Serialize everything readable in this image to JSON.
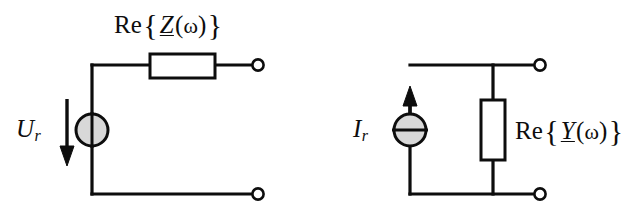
{
  "figure": {
    "width": 635,
    "height": 218,
    "background_color": "#ffffff",
    "line_color": "#0d0d0d",
    "source_fill_color": "#d8d8d8",
    "resistor_fill_color": "#ffffff"
  },
  "left_circuit": {
    "name": "series-equivalent-circuit",
    "source": {
      "type": "voltage-source",
      "symbol": "circle-with-vertical-bar",
      "label_prefix": "U",
      "label_subscript": "r",
      "arrow_direction": "down"
    },
    "impedance_label": {
      "re": "Re",
      "open_brace": "{",
      "symbol": "Z",
      "open_paren": "(",
      "omega": "ω",
      "close_paren": ")",
      "close_brace": "}",
      "full_text": "Re{Z(ω)}"
    },
    "element": {
      "type": "resistor",
      "orientation": "horizontal"
    },
    "terminals": [
      {
        "name": "top-terminal",
        "style": "open-circle"
      },
      {
        "name": "bottom-terminal",
        "style": "open-circle"
      }
    ]
  },
  "right_circuit": {
    "name": "parallel-equivalent-circuit",
    "source": {
      "type": "current-source",
      "symbol": "circle-with-horizontal-bar",
      "label_prefix": "I",
      "label_subscript": "r",
      "arrow_direction": "up"
    },
    "admittance_label": {
      "re": "Re",
      "open_brace": "{",
      "symbol": "Y",
      "open_paren": "(",
      "omega": "ω",
      "close_paren": ")",
      "close_brace": "}",
      "full_text": "Re{Y(ω)}"
    },
    "element": {
      "type": "resistor",
      "orientation": "vertical"
    },
    "terminals": [
      {
        "name": "top-terminal",
        "style": "open-circle"
      },
      {
        "name": "bottom-terminal",
        "style": "open-circle"
      }
    ]
  }
}
